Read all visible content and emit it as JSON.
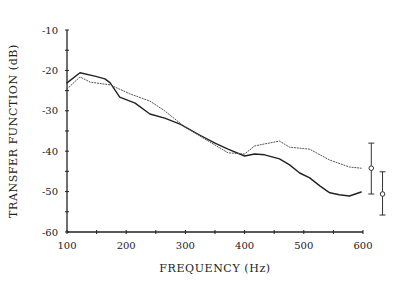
{
  "chart_data": {
    "type": "line",
    "title": "",
    "xlabel": "FREQUENCY (Hz)",
    "ylabel": "TRANSFER FUNCTION (dB)",
    "xlim": [
      100,
      600
    ],
    "ylim": [
      -60,
      -10
    ],
    "xticks": [
      100,
      200,
      300,
      400,
      500,
      600
    ],
    "yticks": [
      -10,
      -20,
      -30,
      -40,
      -50,
      -60
    ],
    "grid": false,
    "legend": null,
    "series": [
      {
        "name": "solid",
        "style": "solid",
        "color": "#222222",
        "x": [
          100,
          122,
          147,
          164,
          173,
          189,
          215,
          240,
          265,
          291,
          324,
          350,
          372,
          400,
          417,
          434,
          459,
          476,
          493,
          510,
          527,
          544,
          560,
          577,
          597
        ],
        "y": [
          -23.1,
          -20.6,
          -21.4,
          -22.1,
          -23.1,
          -26.6,
          -28.1,
          -30.8,
          -31.8,
          -33.3,
          -36.0,
          -38.0,
          -39.5,
          -41.2,
          -40.7,
          -40.9,
          -41.9,
          -43.4,
          -45.4,
          -46.6,
          -48.6,
          -50.3,
          -50.8,
          -51.1,
          -50.1
        ]
      },
      {
        "name": "dotted",
        "style": "dotted",
        "color": "#555555",
        "x": [
          100,
          122,
          139,
          173,
          206,
          240,
          265,
          299,
          341,
          372,
          400,
          417,
          434,
          459,
          476,
          510,
          544,
          577,
          597
        ],
        "y": [
          -24.6,
          -21.6,
          -22.9,
          -23.6,
          -25.8,
          -27.6,
          -30.0,
          -34.0,
          -37.7,
          -40.4,
          -40.7,
          -38.7,
          -38.2,
          -37.5,
          -39.0,
          -39.5,
          -42.2,
          -43.9,
          -44.2
        ]
      }
    ],
    "error_bars": [
      {
        "name": "dotted-error",
        "x": 614,
        "center": -44.2,
        "low": -50.6,
        "high": -38.0
      },
      {
        "name": "solid-error",
        "x": 633,
        "center": -50.6,
        "low": -55.8,
        "high": -45.1
      }
    ]
  },
  "labels": {
    "xlabel": "FREQUENCY  (Hz)",
    "ylabel": "TRANSFER  FUNCTION  (dB)",
    "xticks": [
      "100",
      "200",
      "300",
      "400",
      "500",
      "600"
    ],
    "yticks": [
      "-10",
      "-20",
      "-30",
      "-40",
      "-50",
      "-60"
    ]
  }
}
